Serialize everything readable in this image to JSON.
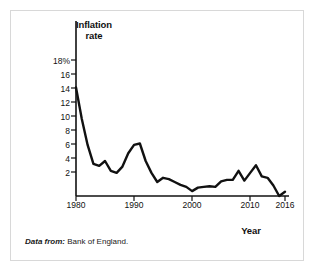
{
  "figure": {
    "border_color": "#d8d8d8",
    "background": "#ffffff"
  },
  "caption": {
    "lead": "Data from:",
    "text": " Bank of England."
  },
  "chart_data": {
    "type": "line",
    "title": "",
    "xlabel": "Year",
    "ylabel": "Inflation rate",
    "ylabel_line1": "Inflation",
    "ylabel_line2": "rate",
    "line_color": "#111111",
    "grid": false,
    "legend": "none",
    "xlim": [
      1980,
      2016
    ],
    "ylim": [
      0,
      18
    ],
    "xticks": [
      1980,
      1990,
      2000,
      2010,
      2016
    ],
    "xticklabels": [
      "1980",
      "1990",
      "2000",
      "2010",
      "2016"
    ],
    "yticks": [
      2,
      4,
      6,
      8,
      10,
      12,
      14,
      16,
      18
    ],
    "yticklabels": [
      "2",
      "4",
      "6",
      "8",
      "10",
      "12",
      "14",
      "16",
      "18%"
    ],
    "x": [
      1980,
      1981,
      1982,
      1983,
      1984,
      1985,
      1986,
      1987,
      1988,
      1989,
      1990,
      1991,
      1992,
      1993,
      1994,
      1995,
      1996,
      1997,
      1998,
      1999,
      2000,
      2001,
      2002,
      2003,
      2004,
      2005,
      2006,
      2007,
      2008,
      2009,
      2010,
      2011,
      2012,
      2013,
      2014,
      2015,
      2016
    ],
    "values": [
      15.5,
      11.0,
      7.3,
      4.6,
      4.3,
      5.0,
      3.6,
      3.3,
      4.2,
      6.1,
      7.3,
      7.5,
      5.0,
      3.3,
      2.0,
      2.6,
      2.4,
      2.0,
      1.6,
      1.3,
      0.7,
      1.2,
      1.3,
      1.4,
      1.3,
      2.1,
      2.3,
      2.3,
      3.6,
      2.2,
      3.3,
      4.4,
      2.8,
      2.6,
      1.5,
      0.0,
      0.6
    ],
    "annotations": [],
    "source": "Bank of England"
  }
}
